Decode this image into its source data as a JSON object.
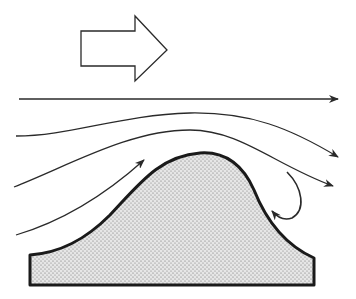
{
  "diagram": {
    "title": "Airflow over a hill (windward lift and leeward eddy)",
    "colors": {
      "background": "#ffffff",
      "stroke": "#2a2a2a",
      "hill_fill": "#d9d9d9",
      "stipple": "#5a5a5a"
    },
    "elements": {
      "wind_direction_arrow": {
        "label": "wind direction",
        "icon": "block-arrow-right"
      },
      "streamlines": [
        {
          "id": "streamline-1",
          "label": "undisturbed flow aloft"
        },
        {
          "id": "streamline-2",
          "label": "upper deflected flow"
        },
        {
          "id": "streamline-3",
          "label": "lower deflected flow"
        },
        {
          "id": "streamline-4",
          "label": "windward upslope flow"
        }
      ],
      "eddy": {
        "label": "leeward eddy (reverse flow)"
      },
      "hill": {
        "label": "hill / ridge"
      }
    }
  }
}
